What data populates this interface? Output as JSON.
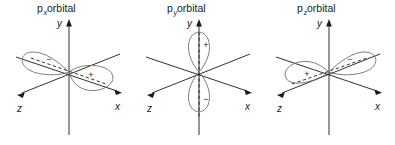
{
  "figure": {
    "name": "p-orbital-shapes",
    "background_color": "#ffffff",
    "line_color": "#1a1a1a",
    "lobe_color": "#6e6e6e"
  },
  "panels": [
    {
      "id": "px",
      "title_main": "p",
      "title_sub": "x",
      "title_rest": " orbital",
      "title_full": "pₓ orbital",
      "axes": [
        {
          "name": "y",
          "label": "y"
        },
        {
          "name": "x",
          "label": "x"
        },
        {
          "name": "z",
          "label": "z"
        }
      ],
      "lobes": [
        {
          "position": "along +x (front-right)",
          "sign": "+"
        },
        {
          "position": "along −x (back-left)",
          "sign": "−"
        }
      ],
      "nodal_axis": "x-axis (dashed)"
    },
    {
      "id": "py",
      "title_main": "p",
      "title_sub": "y",
      "title_rest": " orbital",
      "title_full": "pᵧ orbital",
      "axes": [
        {
          "name": "y",
          "label": "y"
        },
        {
          "name": "x",
          "label": "x"
        },
        {
          "name": "z",
          "label": "z"
        }
      ],
      "lobes": [
        {
          "position": "along +y (up)",
          "sign": "+"
        },
        {
          "position": "along −y (down)",
          "sign": "−"
        }
      ],
      "nodal_axis": "y-axis (dashed)"
    },
    {
      "id": "pz",
      "title_main": "p",
      "title_sub": "z",
      "title_rest": " orbital",
      "title_full": "pᶻ orbital",
      "axes": [
        {
          "name": "y",
          "label": "y"
        },
        {
          "name": "x",
          "label": "x"
        },
        {
          "name": "z",
          "label": "z"
        }
      ],
      "lobes": [
        {
          "position": "along +z (front-left)",
          "sign": "+"
        },
        {
          "position": "along −z (back-right)",
          "sign": "−"
        }
      ],
      "nodal_axis": "z-axis (dashed)"
    }
  ]
}
